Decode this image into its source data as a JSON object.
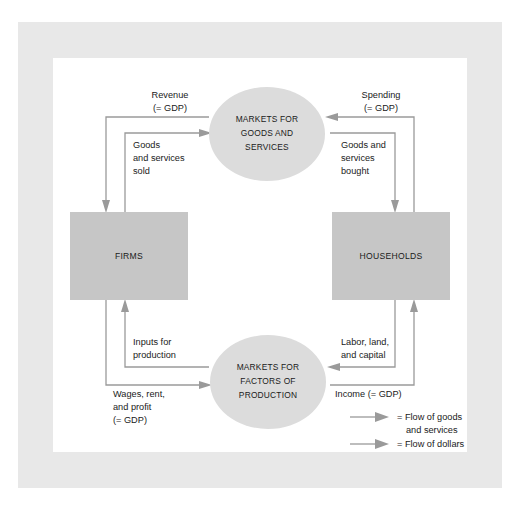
{
  "figure": {
    "type": "circular-flow-diagram",
    "nodes": {
      "firms": "FIRMS",
      "households": "HOUSEHOLDS",
      "markets_goods": [
        "MARKETS FOR",
        "GOODS AND",
        "SERVICES"
      ],
      "markets_factors": [
        "MARKETS FOR",
        "FACTORS OF",
        "PRODUCTION"
      ]
    },
    "flows": {
      "revenue": [
        "Revenue",
        "(= GDP)"
      ],
      "spending": [
        "Spending",
        "(= GDP)"
      ],
      "goods_sold": [
        "Goods",
        "and services",
        "sold"
      ],
      "goods_bought": [
        "Goods and",
        "services",
        "bought"
      ],
      "inputs": [
        "Inputs for",
        "production"
      ],
      "labor": [
        "Labor, land,",
        "and capital"
      ],
      "wages": [
        "Wages, rent,",
        "and profit",
        "(= GDP)"
      ],
      "income": [
        "Income (= GDP)"
      ]
    },
    "legend": [
      {
        "icon": "arrow-right-icon",
        "text": [
          "= Flow of goods",
          "and services"
        ]
      },
      {
        "icon": "arrow-right-icon",
        "text": [
          "= Flow of dollars"
        ]
      }
    ],
    "colors": {
      "box_fill": "#c6c6c6",
      "oval_fill": "#dcdcdc",
      "line": "#9a9a9a",
      "frame": "#e8e8e8",
      "panel": "#ffffff",
      "text": "#1a1a1a"
    }
  }
}
